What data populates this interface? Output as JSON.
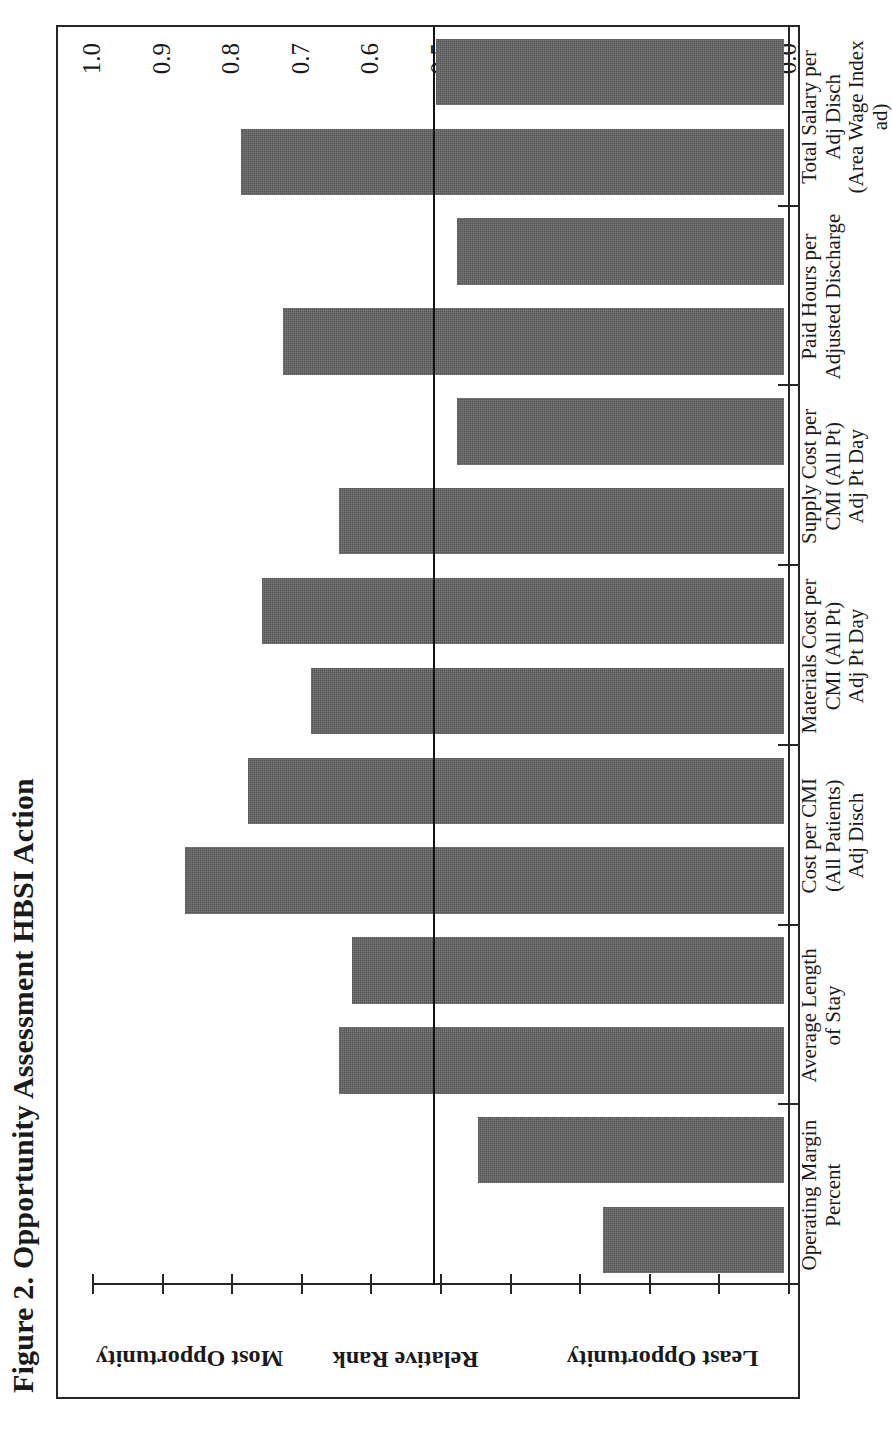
{
  "figure": {
    "title": "Figure 2. Opportunity Assessment HBSI Action",
    "orientation": "rotated-90"
  },
  "axis": {
    "value_axis_label_segments": [
      {
        "key": "most",
        "text": "Most Opportunity"
      },
      {
        "key": "rank",
        "text": "Relative Rank"
      },
      {
        "key": "least",
        "text": "Least Opportunity"
      }
    ],
    "tick_labels": [
      "1.0",
      "0.9",
      "0.8",
      "0.7",
      "0.6",
      "0.5",
      "0.4",
      "0.3",
      "0.2",
      "0.1",
      "0.0"
    ]
  },
  "colors": {
    "bar_fill": "#565656",
    "axis": "#262626",
    "reference_line": "#111111",
    "background": "#ffffff"
  },
  "chart_data": {
    "type": "bar",
    "title": "Figure 2. Opportunity Assessment HBSI Action",
    "orientation": "horizontal-rotated",
    "xlabel": "",
    "ylabel": "Relative Rank",
    "ylim": [
      0.0,
      1.0
    ],
    "grid": false,
    "legend": null,
    "y_tick_values": [
      1.0,
      0.9,
      0.8,
      0.7,
      0.6,
      0.5,
      0.4,
      0.3,
      0.2,
      0.1,
      0.0
    ],
    "y_tick_labels": [
      "1.0",
      "0.9",
      "0.8",
      "0.7",
      "0.6",
      "0.5",
      "0.4",
      "0.3",
      "0.2",
      "0.1",
      "0.0"
    ],
    "axis_zone_labels": [
      "Most Opportunity",
      "Relative Rank",
      "Least Opportunity"
    ],
    "reference_line": {
      "value": 0.51,
      "label": ""
    },
    "categories": [
      "Operating Margin\nPercent",
      "Average Length\nof Stay",
      "Cost per CMI\n(All Patients)\nAdj Disch",
      "Materials Cost per\nCMI (All Pt)\nAdj Pt Day",
      "Supply Cost per\nCMI (All Pt)\nAdj Pt Day",
      "Paid Hours per\nAdjusted Discharge",
      "Total Salary per\nAdj Disch\n(Area Wage Index ad)"
    ],
    "category_lines": [
      [
        "Operating Margin",
        "Percent"
      ],
      [
        "Average Length",
        "of Stay"
      ],
      [
        "Cost per CMI",
        "(All Patients)",
        "Adj Disch"
      ],
      [
        "Materials Cost per",
        "CMI (All Pt)",
        "Adj Pt Day"
      ],
      [
        "Supply Cost per",
        "CMI (All Pt)",
        "Adj Pt Day"
      ],
      [
        "Paid Hours per",
        "Adjusted Discharge"
      ],
      [
        "Total Salary per",
        "Adj Disch",
        "(Area Wage Index ad)"
      ]
    ],
    "values": [
      0.26,
      0.44,
      0.86,
      0.75,
      0.64,
      0.47,
      0.72
    ],
    "sub_values": [
      null,
      0.63,
      0.77,
      0.68,
      0.75,
      0.66,
      0.48
    ],
    "series": [
      {
        "name": "Relative Rank",
        "points": [
          {
            "category": "Operating Margin Percent",
            "value": 0.26
          },
          {
            "category": "Average Length of Stay",
            "value": 0.64
          },
          {
            "category": "Average Length of Stay (2)",
            "value": 0.62
          },
          {
            "category": "Cost per CMI (All Patients) Adj Disch",
            "value": 0.86
          },
          {
            "category": "Materials Cost per CMI (All Pt) Adj Pt Day",
            "value": 0.77
          },
          {
            "category": "Materials Cost per CMI (All Pt) Adj Pt Day (2)",
            "value": 0.68
          },
          {
            "category": "Supply Cost per CMI (All Pt) Adj Pt Day",
            "value": 0.75
          },
          {
            "category": "Supply Cost per CMI (All Pt) Adj Pt Day (2)",
            "value": 0.64
          },
          {
            "category": "Paid Hours per Adjusted Discharge",
            "value": 0.47
          },
          {
            "category": "Paid Hours per Adjusted Discharge (2)",
            "value": 0.72
          },
          {
            "category": "Total Salary per Adj Disch (Area Wage Index ad)",
            "value": 0.47
          },
          {
            "category": "Total Salary per Adj Disch (Area Wage Index ad) (2)",
            "value": 0.78
          },
          {
            "category": "Total Salary per Adj Disch (Area Wage Index ad) (3)",
            "value": 0.5
          }
        ]
      }
    ],
    "bars": [
      {
        "index": 0,
        "value": 0.26,
        "category": "Operating Margin Percent"
      },
      {
        "index": 1,
        "value": 0.44,
        "category": "Operating Margin Percent"
      },
      {
        "index": 2,
        "value": 0.64,
        "category": "Average Length of Stay"
      },
      {
        "index": 3,
        "value": 0.62,
        "category": "Average Length of Stay"
      },
      {
        "index": 4,
        "value": 0.86,
        "category": "Cost per CMI (All Patients) Adj Disch"
      },
      {
        "index": 5,
        "value": 0.77,
        "category": "Cost per CMI (All Patients) Adj Disch"
      },
      {
        "index": 6,
        "value": 0.68,
        "category": "Materials Cost per CMI (All Pt) Adj Pt Day"
      },
      {
        "index": 7,
        "value": 0.75,
        "category": "Materials Cost per CMI (All Pt) Adj Pt Day"
      },
      {
        "index": 8,
        "value": 0.64,
        "category": "Supply Cost per CMI (All Pt) Adj Pt Day"
      },
      {
        "index": 9,
        "value": 0.47,
        "category": "Supply Cost per CMI (All Pt) Adj Pt Day"
      },
      {
        "index": 10,
        "value": 0.72,
        "category": "Paid Hours per Adjusted Discharge"
      },
      {
        "index": 11,
        "value": 0.47,
        "category": "Paid Hours per Adjusted Discharge"
      },
      {
        "index": 12,
        "value": 0.78,
        "category": "Total Salary per Adj Disch (Area Wage Index ad)"
      },
      {
        "index": 13,
        "value": 0.5,
        "category": "Total Salary per Adj Disch (Area Wage Index ad)"
      }
    ]
  }
}
